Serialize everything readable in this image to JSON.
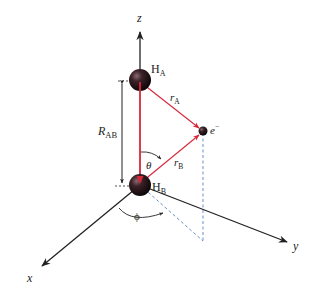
{
  "diagram": {
    "axes": {
      "z": "z",
      "x": "x",
      "y": "y"
    },
    "nuclei": {
      "a": {
        "symbol": "H",
        "subscript": "A"
      },
      "b": {
        "symbol": "H",
        "subscript": "B"
      }
    },
    "electron": {
      "symbol": "e",
      "superscript": "−"
    },
    "distances": {
      "ra": {
        "symbol": "r",
        "subscript": "A"
      },
      "rb": {
        "symbol": "r",
        "subscript": "B"
      },
      "rab": {
        "symbol": "R",
        "subscript": "AB"
      }
    },
    "angles": {
      "theta": "θ",
      "phi": "ϕ"
    },
    "colors": {
      "bond": "#d8263a",
      "axis": "#222222",
      "dashed": "#6a8fc8",
      "sphere": "#2a1a1e"
    }
  }
}
